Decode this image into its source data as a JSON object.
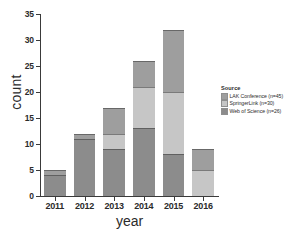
{
  "chart_data": {
    "type": "bar",
    "subtype": "stacked-bar",
    "title": "",
    "xlabel": "year",
    "ylabel": "count",
    "categories": [
      "2011",
      "2012",
      "2013",
      "2014",
      "2015",
      "2016"
    ],
    "ylim": [
      0,
      35
    ],
    "yticks": [
      0,
      5,
      10,
      15,
      20,
      25,
      30,
      35
    ],
    "grid": false,
    "legend_position": "right",
    "legend_title": "Source",
    "series": [
      {
        "name": "Web of Science (n=26)",
        "short_name": "Web of Science",
        "n": 26,
        "color": "#8c8c8c",
        "stack_order": 0,
        "values": [
          4,
          11,
          9,
          13,
          8,
          0
        ]
      },
      {
        "name": "SpringerLink (n=30)",
        "short_name": "SpringerLink",
        "n": 30,
        "color": "#c6c6c6",
        "stack_order": 1,
        "values": [
          0,
          0,
          3,
          8,
          12,
          5
        ]
      },
      {
        "name": "LAK Conference (n=45)",
        "short_name": "LAK Conference",
        "n": 45,
        "color": "#9e9e9e",
        "stack_order": 2,
        "values": [
          1,
          1,
          5,
          5,
          12,
          4
        ]
      }
    ],
    "totals": [
      5,
      12,
      17,
      26,
      32,
      9
    ]
  },
  "axes": {
    "y_title": "count",
    "x_title": "year",
    "y_tick_labels": [
      "0",
      "5",
      "10",
      "15",
      "20",
      "25",
      "30",
      "35"
    ],
    "x_tick_labels": [
      "2011",
      "2012",
      "2013",
      "2014",
      "2015",
      "2016"
    ]
  },
  "legend": {
    "title": "Source",
    "entries": [
      {
        "label": "LAK Conference (n=45)",
        "color": "#9e9e9e"
      },
      {
        "label": "SpringerLink (n=30)",
        "color": "#c6c6c6"
      },
      {
        "label": "Web of Science (n=26)",
        "color": "#8c8c8c"
      }
    ]
  },
  "colors": {
    "background": "#ffffff",
    "axis": "#3a3a3a",
    "text": "#2b2b2b"
  }
}
